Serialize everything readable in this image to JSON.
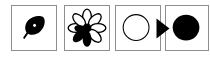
{
  "figure": {
    "background_color": "#ffffff",
    "panel_border_color": "#8e8e8e",
    "shape_fill_black": "#000000",
    "shape_fill_white": "#ffffff",
    "panel_count": 4
  },
  "panels": [
    {
      "index": 1,
      "icon_name": "leaf-icon",
      "label": "Leaf",
      "fill": "black",
      "x": 11,
      "y": 5,
      "w": 46,
      "h": 46
    },
    {
      "index": 2,
      "icon_name": "flower-icon",
      "label": "Flower",
      "fill": "outline-and-black",
      "petal_count": 8,
      "filled_petal_count": 3,
      "x": 64,
      "y": 5,
      "w": 46,
      "h": 46
    },
    {
      "index": 3,
      "icon_name": "circle-outline-icon",
      "label": "Circle outline",
      "fill": "white",
      "x": 115,
      "y": 5,
      "w": 46,
      "h": 46
    },
    {
      "index": 4,
      "icon_name": "circle-filled-icon",
      "label": "Filled circle",
      "fill": "black",
      "x": 165,
      "y": 5,
      "w": 44,
      "h": 46
    }
  ],
  "arrow": {
    "icon_name": "triangle-right-arrow-icon",
    "label": "Proceeds to",
    "color": "#000000",
    "x": 156,
    "y": 18,
    "w": 14,
    "h": 21
  }
}
